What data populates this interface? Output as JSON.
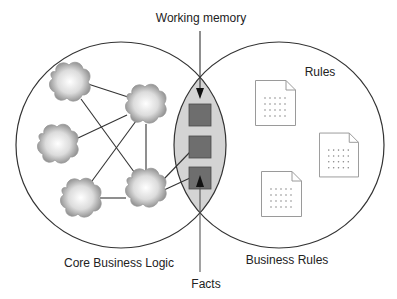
{
  "labels": {
    "working_memory": "Working memory",
    "rules": "Rules",
    "core_business_logic": "Core Business Logic",
    "business_rules": "Business Rules",
    "facts": "Facts"
  },
  "colors": {
    "circle_stroke": "#333333",
    "intersection_fill": "#d4d4d4",
    "square_fill": "#6e6e6e",
    "square_stroke": "#4a4a4a",
    "cloud_edge": "#8a8a8a",
    "cloud_center": "#ffffff",
    "link_stroke": "#333333",
    "doc_stroke": "#9a9a9a",
    "doc_dots": "#888888"
  },
  "circles": [
    {
      "name": "core-business-logic-circle",
      "cx": 121,
      "cy": 145,
      "rx": 105,
      "ry": 103
    },
    {
      "name": "business-rules-circle",
      "cx": 279,
      "cy": 145,
      "rx": 105,
      "ry": 103
    }
  ],
  "clouds": [
    {
      "name": "logic-node-1",
      "cx": 70,
      "cy": 82
    },
    {
      "name": "logic-node-2",
      "cx": 146,
      "cy": 104
    },
    {
      "name": "logic-node-3",
      "cx": 58,
      "cy": 144
    },
    {
      "name": "logic-node-4",
      "cx": 81,
      "cy": 198
    },
    {
      "name": "logic-node-5",
      "cx": 146,
      "cy": 188
    }
  ],
  "links": [
    {
      "from": "logic-node-1",
      "to": "logic-node-2",
      "x1": 88,
      "y1": 84,
      "x2": 128,
      "y2": 97
    },
    {
      "from": "logic-node-1",
      "to": "logic-node-5",
      "x1": 81,
      "y1": 99,
      "x2": 137,
      "y2": 176
    },
    {
      "from": "logic-node-2",
      "to": "logic-node-3",
      "x1": 127,
      "y1": 115,
      "x2": 78,
      "y2": 138
    },
    {
      "from": "logic-node-2",
      "to": "logic-node-4",
      "x1": 136,
      "y1": 121,
      "x2": 92,
      "y2": 181
    },
    {
      "from": "logic-node-2",
      "to": "logic-node-5",
      "x1": 146,
      "y1": 124,
      "x2": 146,
      "y2": 170
    },
    {
      "from": "logic-node-4",
      "to": "logic-node-5",
      "x1": 100,
      "y1": 198,
      "x2": 126,
      "y2": 198
    },
    {
      "from": "logic-node-5",
      "to": "fact-2",
      "x1": 163,
      "y1": 180,
      "x2": 190,
      "y2": 152
    },
    {
      "from": "logic-node-5",
      "to": "fact-3",
      "x1": 164,
      "y1": 190,
      "x2": 190,
      "y2": 178
    }
  ],
  "facts": [
    {
      "name": "fact-1",
      "x": 189,
      "y": 104,
      "w": 22,
      "h": 22
    },
    {
      "name": "fact-2",
      "x": 189,
      "y": 136,
      "w": 22,
      "h": 22
    },
    {
      "name": "fact-3",
      "x": 189,
      "y": 167,
      "w": 22,
      "h": 22
    }
  ],
  "rule_documents": [
    {
      "name": "rule-document-1",
      "x": 255,
      "y": 80,
      "w": 41,
      "h": 46
    },
    {
      "name": "rule-document-2",
      "x": 319,
      "y": 132,
      "w": 40,
      "h": 46
    },
    {
      "name": "rule-document-3",
      "x": 261,
      "y": 171,
      "w": 41,
      "h": 46
    }
  ]
}
